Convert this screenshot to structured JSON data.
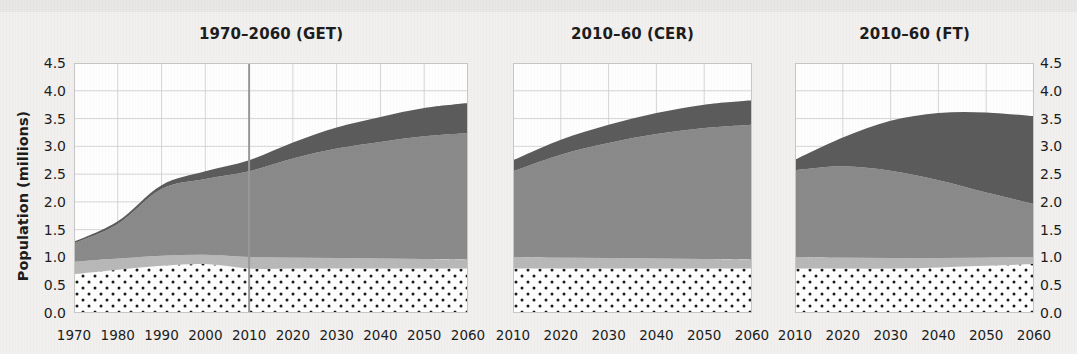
{
  "figure": {
    "cut_top_text": "",
    "background_color": "#f2f1ef",
    "plot_background": "#ffffff"
  },
  "axes": {
    "ylabel": "Population (millions)",
    "yticks": [
      "4.5",
      "4.0",
      "3.5",
      "3.0",
      "2.5",
      "2.0",
      "1.5",
      "1.0",
      "0.5",
      "0.0"
    ],
    "ytick_values": [
      4.5,
      4.0,
      3.5,
      3.0,
      2.5,
      2.0,
      1.5,
      1.0,
      0.5,
      0.0
    ],
    "ylim": [
      0,
      4.5
    ]
  },
  "colors": {
    "band_top_dark": "#5c5c5c",
    "band_mid_gray": "#8b8b8b",
    "band_light_gray": "#b9b9b9",
    "band_dotted_base": "#ffffff",
    "dot_color": "#1b1b1b",
    "grid": "#cdcdcd",
    "frame": "#c8c8c8",
    "divider_line": "#9a9a9a",
    "text": "#1d1d1d",
    "page_background": "#f2f1ef"
  },
  "panels": [
    {
      "id": "get",
      "title": "1970–2060 (GET)",
      "xticks": [
        "1970",
        "1980",
        "1990",
        "2000",
        "2010",
        "2020",
        "2030",
        "2040",
        "2050",
        "2060"
      ],
      "xlim": [
        1970,
        2060
      ],
      "divider_year": 2010
    },
    {
      "id": "cer",
      "title": "2010–60 (CER)",
      "xticks": [
        "2010",
        "2020",
        "2030",
        "2040",
        "2050",
        "2060"
      ],
      "xlim": [
        2010,
        2060
      ],
      "divider_year": null
    },
    {
      "id": "ft",
      "title": "2010–60 (FT)",
      "xticks": [
        "2010",
        "2020",
        "2030",
        "2040",
        "2050",
        "2060"
      ],
      "xlim": [
        2010,
        2060
      ],
      "divider_year": null
    }
  ],
  "chart_data": {
    "type": "area",
    "title": "",
    "subtitle": "",
    "xlabel": "",
    "ylabel": "Population (millions)",
    "ylim": [
      0,
      4.5
    ],
    "grid": true,
    "legend": "none",
    "stacked": true,
    "layout": "three side-by-side stacked area panels sharing a 0.0–4.5 y-axis; left y-tick labels and mirrored right y-tick labels",
    "band_order_bottom_to_top": [
      "dotted",
      "light-gray",
      "mid-gray",
      "dark-gray"
    ],
    "panels": [
      {
        "id": "get",
        "title": "1970–2060 (GET)",
        "x": [
          1970,
          1980,
          1990,
          2000,
          2010,
          2020,
          2030,
          2040,
          2050,
          2060
        ],
        "xlim": [
          1970,
          2060
        ],
        "xticks": [
          "1970",
          "1980",
          "1990",
          "2000",
          "2010",
          "2020",
          "2030",
          "2040",
          "2050",
          "2060"
        ],
        "divider_year": 2010,
        "series": [
          {
            "name": "dotted",
            "values": [
              0.7,
              0.78,
              0.85,
              0.88,
              0.8,
              0.8,
              0.8,
              0.8,
              0.8,
              0.8
            ]
          },
          {
            "name": "light-gray",
            "values": [
              0.22,
              0.2,
              0.18,
              0.17,
              0.21,
              0.2,
              0.19,
              0.18,
              0.17,
              0.16
            ]
          },
          {
            "name": "mid-gray",
            "values": [
              0.33,
              0.62,
              1.2,
              1.36,
              1.54,
              1.78,
              1.97,
              2.1,
              2.21,
              2.28
            ]
          },
          {
            "name": "dark-gray",
            "values": [
              0.03,
              0.05,
              0.07,
              0.14,
              0.2,
              0.29,
              0.38,
              0.45,
              0.51,
              0.54
            ]
          }
        ],
        "totals": [
          1.28,
          1.65,
          2.3,
          2.55,
          2.75,
          3.07,
          3.34,
          3.53,
          3.69,
          3.78
        ]
      },
      {
        "id": "cer",
        "title": "2010–60 (CER)",
        "x": [
          2010,
          2020,
          2030,
          2040,
          2050,
          2060
        ],
        "xlim": [
          2010,
          2060
        ],
        "xticks": [
          "2010",
          "2020",
          "2030",
          "2040",
          "2050",
          "2060"
        ],
        "divider_year": null,
        "series": [
          {
            "name": "dotted",
            "values": [
              0.8,
              0.8,
              0.8,
              0.8,
              0.8,
              0.8
            ]
          },
          {
            "name": "light-gray",
            "values": [
              0.21,
              0.2,
              0.19,
              0.18,
              0.17,
              0.16
            ]
          },
          {
            "name": "mid-gray",
            "values": [
              1.54,
              1.85,
              2.07,
              2.24,
              2.36,
              2.43
            ]
          },
          {
            "name": "dark-gray",
            "values": [
              0.2,
              0.27,
              0.33,
              0.38,
              0.42,
              0.44
            ]
          }
        ],
        "totals": [
          2.75,
          3.12,
          3.39,
          3.6,
          3.75,
          3.83
        ]
      },
      {
        "id": "ft",
        "title": "2010–60 (FT)",
        "x": [
          2010,
          2020,
          2030,
          2040,
          2050,
          2060
        ],
        "xlim": [
          2010,
          2060
        ],
        "xticks": [
          "2010",
          "2020",
          "2030",
          "2040",
          "2050",
          "2060"
        ],
        "divider_year": null,
        "series": [
          {
            "name": "dotted",
            "values": [
              0.8,
              0.8,
              0.8,
              0.82,
              0.85,
              0.88
            ]
          },
          {
            "name": "light-gray",
            "values": [
              0.21,
              0.2,
              0.19,
              0.17,
              0.15,
              0.13
            ]
          },
          {
            "name": "mid-gray",
            "values": [
              1.56,
              1.64,
              1.57,
              1.4,
              1.17,
              0.95
            ]
          },
          {
            "name": "dark-gray",
            "values": [
              0.19,
              0.52,
              0.9,
              1.21,
              1.44,
              1.58
            ]
          }
        ],
        "totals": [
          2.76,
          3.16,
          3.46,
          3.6,
          3.61,
          3.54
        ]
      }
    ]
  }
}
